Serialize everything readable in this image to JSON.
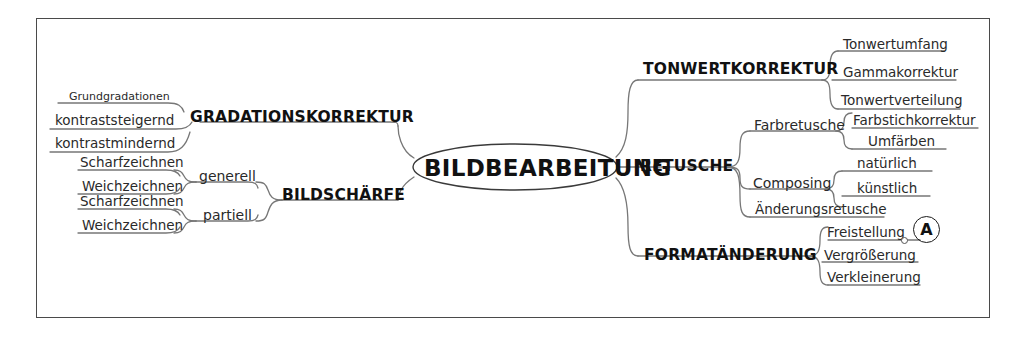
{
  "diagram": {
    "type": "mind-map",
    "title": "BILDBEARBEITUNG",
    "root": {
      "label": "BILDBEARBEITUNG"
    },
    "branches": [
      {
        "label": "GRADATIONSKORREKTUR",
        "side": "left",
        "children": [
          {
            "label": "Grundgradationen",
            "size": "small"
          },
          {
            "label": "kontraststeigernd",
            "size": "normal"
          },
          {
            "label": "kontrastmindernd",
            "size": "normal"
          }
        ]
      },
      {
        "label": "BILDSCHÄRFE",
        "side": "left",
        "children": [
          {
            "label": "generell",
            "children": [
              {
                "label": "Scharfzeichnen"
              },
              {
                "label": "Weichzeichnen"
              }
            ]
          },
          {
            "label": "partiell",
            "children": [
              {
                "label": "Scharfzeichnen"
              },
              {
                "label": "Weichzeichnen"
              }
            ]
          }
        ]
      },
      {
        "label": "TONWERTKORREKTUR",
        "side": "right",
        "children": [
          {
            "label": "Tonwertumfang"
          },
          {
            "label": "Gammakorrektur"
          },
          {
            "label": "Tonwertverteilung"
          }
        ]
      },
      {
        "label": "RETUSCHE",
        "side": "right",
        "children": [
          {
            "label": "Farbretusche",
            "children": [
              {
                "label": "Farbstichkorrektur"
              },
              {
                "label": "Umfärben"
              }
            ]
          },
          {
            "label": "Composing",
            "children": [
              {
                "label": "natürlich"
              },
              {
                "label": "künstlich"
              }
            ]
          },
          {
            "label": "Änderungsretusche"
          }
        ]
      },
      {
        "label": "FORMATÄNDERUNG",
        "side": "right",
        "children": [
          {
            "label": "Freistellung"
          },
          {
            "label": "Vergrößerung"
          },
          {
            "label": "Verkleinerung"
          }
        ]
      }
    ],
    "annotations": [
      {
        "label": "A",
        "shape": "circled-letter"
      }
    ],
    "colors": {
      "frame_border": "#4a4a4a",
      "line": "#777777",
      "text": "#1a1a1a",
      "background": "#ffffff"
    }
  },
  "labels": {
    "root": "BILDBEARBEITUNG",
    "gradationskorrektur": "GRADATIONSKORREKTUR",
    "grundgradationen": "Grundgradationen",
    "kontraststeigernd": "kontraststeigernd",
    "kontrastmindernd": "kontrastmindernd",
    "bildschaerfe": "BILDSCHÄRFE",
    "generell": "generell",
    "partiell": "partiell",
    "scharfzeichnen_gen": "Scharfzeichnen",
    "weichzeichnen_gen": "Weichzeichnen",
    "scharfzeichnen_par": "Scharfzeichnen",
    "weichzeichnen_par": "Weichzeichnen",
    "tonwertkorrektur": "TONWERTKORREKTUR",
    "tonwertumfang": "Tonwertumfang",
    "gammakorrektur": "Gammakorrektur",
    "tonwertverteilung": "Tonwertverteilung",
    "retusche": "RETUSCHE",
    "farbretusche": "Farbretusche",
    "farbstichkorrektur": "Farbstichkorrektur",
    "umfaerben": "Umfärben",
    "composing": "Composing",
    "natuerlich": "natürlich",
    "kuenstlich": "künstlich",
    "aenderungsretusche": "Änderungsretusche",
    "formataenderung": "FORMATÄNDERUNG",
    "freistellung": "Freistellung",
    "vergroesserung": "Vergrößerung",
    "verkleinerung": "Verkleinerung",
    "marker_a": "A"
  }
}
